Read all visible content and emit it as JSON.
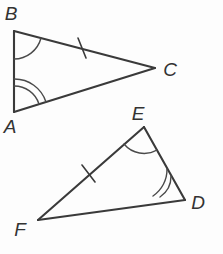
{
  "figure": {
    "background_color": "#fdfdfd",
    "line_color": "#3a3a3a",
    "arc_color": "#4a4a4a",
    "label_color": "#333333"
  },
  "triangles": [
    {
      "name": "triangle-abc",
      "vertices": [
        {
          "label": "B",
          "x": 14,
          "y": 31,
          "label_x": 11,
          "label_y": 20,
          "angle_arcs": 1
        },
        {
          "label": "C",
          "x": 155,
          "y": 68,
          "label_x": 170,
          "label_y": 76,
          "angle_arcs": 0
        },
        {
          "label": "A",
          "x": 14,
          "y": 112,
          "label_x": 10,
          "label_y": 133,
          "angle_arcs": 2
        }
      ],
      "tick_edges": [
        {
          "from": "B",
          "to": "C",
          "ticks": 1
        }
      ]
    },
    {
      "name": "triangle-def",
      "vertices": [
        {
          "label": "E",
          "x": 144,
          "y": 127,
          "label_x": 138,
          "label_y": 120,
          "angle_arcs": 1
        },
        {
          "label": "D",
          "x": 185,
          "y": 200,
          "label_x": 198,
          "label_y": 209,
          "angle_arcs": 2
        },
        {
          "label": "F",
          "x": 38,
          "y": 220,
          "label_x": 20,
          "label_y": 236,
          "angle_arcs": 0
        }
      ],
      "tick_edges": [
        {
          "from": "F",
          "to": "E",
          "ticks": 1
        }
      ]
    }
  ],
  "labels": {
    "b": "B",
    "c": "C",
    "a": "A",
    "e": "E",
    "d": "D",
    "f": "F"
  }
}
